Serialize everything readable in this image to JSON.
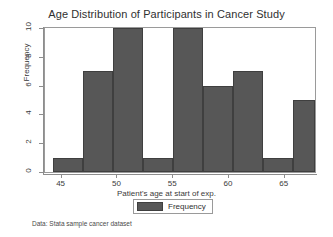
{
  "chart_data": {
    "type": "bar",
    "title": "Age Distribution of Participants in Cancer Study",
    "xlabel": "Patient's age at start of exp.",
    "ylabel": "Frequency",
    "note": "Data:  Stata sample cancer dataset",
    "legend": {
      "position": "bottom",
      "entries": [
        "Frequency"
      ]
    },
    "grid": false,
    "xlim": [
      43.6,
      67.8
    ],
    "ylim": [
      0,
      10
    ],
    "xticks": [
      45,
      50,
      55,
      60,
      65
    ],
    "yticks": [
      0,
      2,
      4,
      6,
      8,
      10
    ],
    "bin_width": 2.69,
    "bin_edges": [
      44.3,
      46.99,
      49.68,
      52.37,
      55.06,
      57.75,
      60.44,
      63.13,
      65.82,
      67.8
    ],
    "categories": [
      "44.3–47.0",
      "47.0–49.7",
      "49.7–52.4",
      "52.4–55.1",
      "55.1–57.8",
      "57.8–60.4",
      "60.4–63.1",
      "63.1–65.8",
      "65.8–67.8"
    ],
    "values": [
      1,
      7,
      10,
      1,
      10,
      6,
      7,
      1,
      5
    ],
    "series": [
      {
        "name": "Frequency",
        "values": [
          1,
          7,
          10,
          1,
          10,
          6,
          7,
          1,
          5
        ]
      }
    ],
    "colors": {
      "bar_fill": "#575757",
      "bar_edge": "#3f3f3f",
      "frame": "#9a9a9a",
      "background": "#ffffff"
    }
  }
}
